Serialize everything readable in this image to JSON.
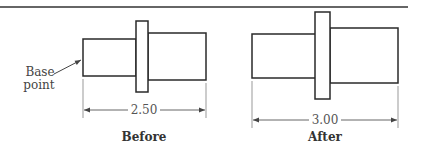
{
  "figure": {
    "top_rule": true,
    "panels": [
      {
        "id": "before",
        "caption": "Before",
        "dimension": "2.50",
        "annotation": {
          "line1": "Base",
          "line2": "point"
        }
      },
      {
        "id": "after",
        "caption": "After",
        "dimension": "3.00"
      }
    ]
  },
  "labels": {
    "before_caption": "Before",
    "after_caption": "After",
    "before_dim": "2.50",
    "after_dim": "3.00",
    "base_line1": "Base",
    "base_line2": "point"
  }
}
